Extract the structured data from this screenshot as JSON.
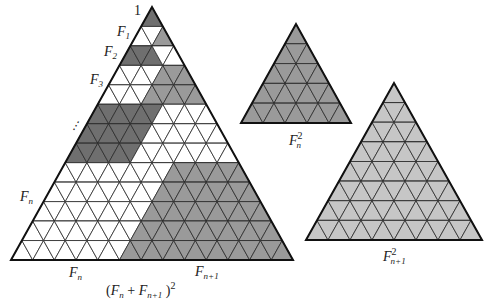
{
  "figure": {
    "colors": {
      "dark": "#6f6f6f",
      "medium": "#9a9a9a",
      "light": "#c6c6c6",
      "white": "#ffffff",
      "line": "#2b2b2b"
    },
    "main_triangle": {
      "apex": [
        152,
        7
      ],
      "base_y": 260,
      "base_left_x": 11,
      "base_right_x": 293,
      "rows": 13,
      "row_fills": [
        {
          "left": "dark",
          "left_count": 1,
          "right": "medium"
        },
        {
          "left": "white",
          "left_count": 2,
          "right": "medium"
        },
        {
          "left": "dark",
          "left_count": 3,
          "right": "white"
        },
        {
          "left": "white",
          "left_count": 4,
          "right": "medium"
        },
        {
          "left": "white",
          "left_count": 4,
          "right": "medium"
        },
        {
          "left": "dark",
          "left_count": 6,
          "right": "white"
        },
        {
          "left": "dark",
          "left_count": 6,
          "right": "white"
        },
        {
          "left": "dark",
          "left_count": 6,
          "right": "white"
        },
        {
          "left": "white",
          "left_count": 10,
          "right": "medium"
        },
        {
          "left": "white",
          "left_count": 10,
          "right": "medium"
        },
        {
          "left": "white",
          "left_count": 10,
          "right": "medium"
        },
        {
          "left": "white",
          "left_count": 10,
          "right": "medium"
        },
        {
          "left": "white",
          "left_count": 10,
          "right": "medium"
        }
      ]
    },
    "small_triangle": {
      "apex": [
        296,
        24
      ],
      "base_y": 123,
      "base_left_x": 241,
      "base_right_x": 351,
      "rows": 5,
      "fill": "medium"
    },
    "large_triangle": {
      "apex": [
        394,
        83
      ],
      "base_y": 240,
      "base_left_x": 306,
      "base_right_x": 482,
      "rows": 8,
      "fill": "light"
    }
  },
  "labels": {
    "apex_one": "1",
    "f1": {
      "base": "F",
      "sub": "1"
    },
    "f2": {
      "base": "F",
      "sub": "2"
    },
    "f3": {
      "base": "F",
      "sub": "3"
    },
    "dots": "⋮",
    "fn_side": {
      "base": "F",
      "sub": "n"
    },
    "fn_bottom": {
      "base": "F",
      "sub": "n"
    },
    "fn1_bottom": {
      "base": "F",
      "sub": "n+1"
    },
    "sum_square": {
      "open": "(",
      "a": "F",
      "a_sub": "n",
      "plus": " + ",
      "b": "F",
      "b_sub": "n+1",
      "close": " )",
      "exp": "2"
    },
    "fn_squared": {
      "base": "F",
      "sub": "n",
      "sup": "2"
    },
    "fn1_squared": {
      "base": "F",
      "sub": "n+1",
      "sup": "2"
    }
  }
}
